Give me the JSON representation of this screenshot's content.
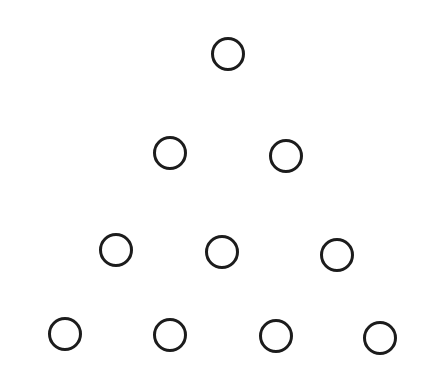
{
  "figure": {
    "stroke_color": "#1c1c1c",
    "background_color": "#ffffff",
    "radius": 16,
    "rows": [
      {
        "row": 1,
        "count": 1,
        "circles": [
          {
            "cx": 228,
            "cy": 54
          }
        ]
      },
      {
        "row": 2,
        "count": 2,
        "circles": [
          {
            "cx": 170,
            "cy": 153
          },
          {
            "cx": 286,
            "cy": 156
          }
        ]
      },
      {
        "row": 3,
        "count": 3,
        "circles": [
          {
            "cx": 116,
            "cy": 250
          },
          {
            "cx": 222,
            "cy": 252
          },
          {
            "cx": 337,
            "cy": 255
          }
        ]
      },
      {
        "row": 4,
        "count": 4,
        "circles": [
          {
            "cx": 65,
            "cy": 334
          },
          {
            "cx": 170,
            "cy": 335
          },
          {
            "cx": 276,
            "cy": 336
          },
          {
            "cx": 380,
            "cy": 338
          }
        ]
      }
    ]
  }
}
